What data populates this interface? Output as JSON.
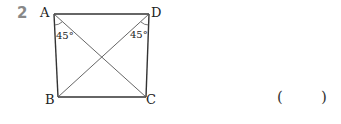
{
  "question": {
    "number": "2",
    "answer_open": "(",
    "answer_close": ")"
  },
  "figure": {
    "type": "quadrilateral-with-diagonals",
    "vertices": {
      "A": "A",
      "B": "B",
      "C": "C",
      "D": "D"
    },
    "angles": {
      "at_A": "45°",
      "at_D": "45°"
    },
    "line_color": "#333333"
  }
}
